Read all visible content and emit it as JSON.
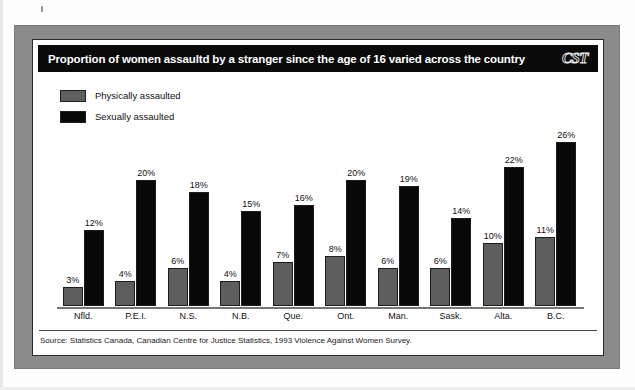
{
  "figure": {
    "title": "Proportion of women assaultd by a stranger since the age of 16 varied across the country",
    "logo": "CST",
    "source": "Source: Statistics Canada, Canadian Centre for Justice Statistics, 1993 Violence Against Women Survey."
  },
  "legend": {
    "items": [
      {
        "label": "Physically assaulted",
        "color": "#5e5e5e",
        "swatch": "gray"
      },
      {
        "label": "Sexually assaulted",
        "color": "#080808",
        "swatch": "black"
      }
    ]
  },
  "colors": {
    "frame": "#8b8b8b",
    "title_bar": "#0a0a0a",
    "physically_assaulted": "#5e5e5e",
    "sexually_assaulted": "#080808",
    "axis": "#767676",
    "page": "#ffffff"
  },
  "chart_data": {
    "type": "bar",
    "title": "Proportion of women assaultd by a stranger since the age of 16 varied across the country",
    "xlabel": "",
    "ylabel": "",
    "ylim": [
      0,
      26
    ],
    "grid": false,
    "legend_position": "top-left",
    "value_suffix": "%",
    "categories": [
      "Nfld.",
      "P.E.I.",
      "N.S.",
      "N.B.",
      "Que.",
      "Ont.",
      "Man.",
      "Sask.",
      "Alta.",
      "B.C."
    ],
    "series": [
      {
        "name": "Physically assaulted",
        "color": "#5e5e5e",
        "values": [
          3,
          4,
          6,
          4,
          7,
          8,
          6,
          6,
          10,
          11
        ],
        "labels": [
          "3%",
          "4%",
          "6%",
          "4%",
          "7%",
          "8%",
          "6%",
          "6%",
          "10%",
          "11%"
        ]
      },
      {
        "name": "Sexually assaulted",
        "color": "#080808",
        "values": [
          12,
          20,
          18,
          15,
          16,
          20,
          19,
          14,
          22,
          26
        ],
        "labels": [
          "12%",
          "20%",
          "18%",
          "15%",
          "16%",
          "20%",
          "19%",
          "14%",
          "22%",
          "26%"
        ]
      }
    ],
    "source": "Source: Statistics Canada, Canadian Centre for Justice Statistics, 1993 Violence Against Women Survey."
  }
}
